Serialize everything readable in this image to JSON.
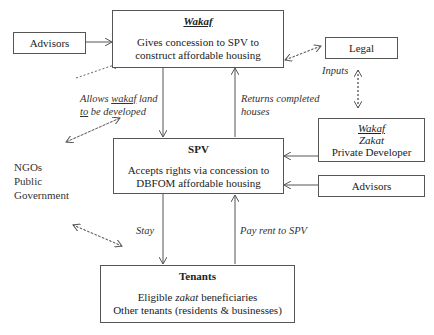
{
  "nodes": {
    "wakaf_top": {
      "title": "Wakaf",
      "line1": "Gives concession to SPV to",
      "line2": "construct affordable housing"
    },
    "advisors_left": {
      "label": "Advisors"
    },
    "legal": {
      "label": "Legal"
    },
    "spv": {
      "title": "SPV",
      "line1": "Accepts rights via concession to",
      "line2": "DBFOM affordable housing"
    },
    "providers": {
      "line1": "Wakaf",
      "line2": "Zakat",
      "line3": "Private Developer"
    },
    "advisors_right": {
      "label": "Advisors"
    },
    "tenants": {
      "title": "Tenants",
      "line1_pre": "Eligible ",
      "line1_it": "zakat",
      "line1_post": " beneficiaries",
      "line2": "Other tenants (residents & businesses)"
    },
    "stakeholders": {
      "line1": "NGOs",
      "line2": "Public",
      "line3": "Government"
    }
  },
  "edges": {
    "allows_1_pre": "Allows ",
    "allows_1_ul": "wakaf",
    "allows_1_post": " land",
    "allows_2_ul": "to",
    "allows_2_post": " be developed",
    "returns_1": "Returns completed",
    "returns_2": "houses",
    "inputs": "Inputs",
    "stay": "Stay",
    "pay_rent": "Pay rent to SPV"
  }
}
